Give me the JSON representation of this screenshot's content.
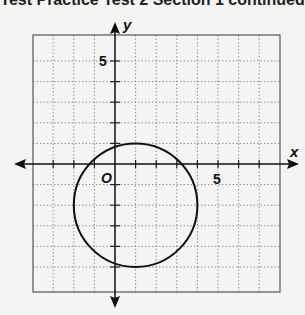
{
  "header": {
    "title": "Test Practice Test 2 Section 1 continued"
  },
  "graph": {
    "x_label": "x",
    "y_label": "y",
    "origin_label": "O",
    "x_tick_label": "5",
    "y_tick_label": "5",
    "x_range": [
      -4,
      8
    ],
    "y_range": [
      -6,
      6
    ],
    "grid": true
  },
  "chart_data": {
    "type": "scatter",
    "title": "",
    "xlabel": "x",
    "ylabel": "y",
    "xlim": [
      -4,
      8
    ],
    "ylim": [
      -6,
      6
    ],
    "grid": true,
    "shapes": [
      {
        "shape": "circle",
        "center": [
          1,
          -2
        ],
        "radius": 3
      }
    ],
    "tick_labels": {
      "x": [
        "5"
      ],
      "y": [
        "5"
      ]
    }
  }
}
